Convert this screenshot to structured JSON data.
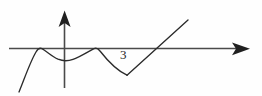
{
  "figure": {
    "background_color": "#fefefe",
    "width": 262,
    "height": 96,
    "axis_color": "#4a4a4a",
    "curve_color": "#2b2b2b",
    "label_color": "#1e1e1e"
  },
  "annotations": {
    "point_label_3": "3"
  },
  "chart_data": {
    "type": "line",
    "title": "",
    "xlabel": "",
    "ylabel": "",
    "grid": false,
    "legend": null,
    "axes": {
      "x_axis": {
        "pixel_y": 48,
        "pixel_x_start": 9,
        "pixel_x_end": 250,
        "arrow_at": "right"
      },
      "y_axis": {
        "pixel_x": 64.5,
        "pixel_y_top": 11,
        "pixel_y_bottom": 88,
        "arrow_at": "top"
      }
    },
    "tick_labels": [
      "3"
    ],
    "annotations": [
      {
        "text": "3",
        "pixel_x": 120,
        "pixel_y": 58,
        "meaning": "x-value marker near descending branch"
      }
    ],
    "features": [
      {
        "kind": "curve-start",
        "pixel_x": 19,
        "pixel_y": 92
      },
      {
        "kind": "tangent-touch-zero",
        "pixel_x": 41,
        "pixel_y": 48
      },
      {
        "kind": "local-minimum",
        "pixel_x": 70,
        "pixel_y": 60
      },
      {
        "kind": "tangent-touch-zero",
        "pixel_x": 98,
        "pixel_y": 48
      },
      {
        "kind": "cusp-minimum",
        "pixel_x": 127,
        "pixel_y": 75
      },
      {
        "kind": "axis-crossing",
        "pixel_x": 155,
        "pixel_y": 48
      },
      {
        "kind": "curve-end",
        "pixel_x": 188,
        "pixel_y": 20
      }
    ],
    "paths": {
      "smooth_curve": "M 19,92 C 24,80 30,62 36,52 C 38,48.5 40,47.6 42,48.6 C 47,51.6 52,56.6 58,59.2 C 63,61.2 68,61.2 73,59.4 C 80,56.8 88,51.6 94,48.6 C 96,47.6 98,48.3 100,51 C 107,60 117,70.5 127,75.2",
      "straight_segment": "M 127,75.2 L 188,20"
    }
  }
}
